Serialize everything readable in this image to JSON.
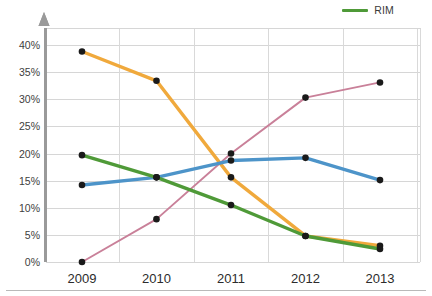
{
  "legend": {
    "position": "top-right",
    "entries": [
      {
        "label": "RIM",
        "color": "#4f9a38",
        "icon": "legend-line-swatch"
      }
    ]
  },
  "axes": {
    "y_ticks": [
      "0%",
      "5%",
      "10%",
      "15%",
      "20%",
      "25%",
      "30%",
      "35%",
      "40%"
    ],
    "x_ticks": [
      "2009",
      "2010",
      "2011",
      "2012",
      "2013"
    ],
    "y_axis_arrow": "up-arrow-icon"
  },
  "chart_data": {
    "type": "line",
    "title": "",
    "xlabel": "",
    "ylabel": "",
    "x": [
      2009,
      2010,
      2011,
      2012,
      2013
    ],
    "categories": [
      "2009",
      "2010",
      "2011",
      "2012",
      "2013"
    ],
    "ylim": [
      0,
      40
    ],
    "ytick_values": [
      0,
      5,
      10,
      15,
      20,
      25,
      30,
      35,
      40
    ],
    "ytick_labels": [
      "0%",
      "5%",
      "10%",
      "15%",
      "20%",
      "25%",
      "30%",
      "35%",
      "40%"
    ],
    "grid": true,
    "legend": [
      "RIM"
    ],
    "legend_position": "top-right",
    "markers": true,
    "series": [
      {
        "name": "orange-series",
        "color": "#f0a93c",
        "width": 3.4,
        "values": [
          38.8,
          33.4,
          15.6,
          4.8,
          3.0
        ]
      },
      {
        "name": "pink-series",
        "color": "#c98099",
        "width": 1.9,
        "values": [
          0.0,
          7.9,
          20.0,
          30.3,
          33.1
        ]
      },
      {
        "name": "blue-series",
        "color": "#4d94c9",
        "width": 3.4,
        "values": [
          14.2,
          15.6,
          18.7,
          19.2,
          15.1
        ]
      },
      {
        "name": "RIM",
        "color": "#4f9a38",
        "width": 3.4,
        "values": [
          19.7,
          15.6,
          10.5,
          4.8,
          2.4
        ]
      }
    ]
  },
  "colors": {
    "orange": "#f0a93c",
    "pink": "#c98099",
    "blue": "#4d94c9",
    "green": "#4f9a38",
    "marker": "#1a1a1a",
    "grid": "#d6d6d6",
    "axis": "#9a9a9a",
    "background": "#ffffff"
  }
}
